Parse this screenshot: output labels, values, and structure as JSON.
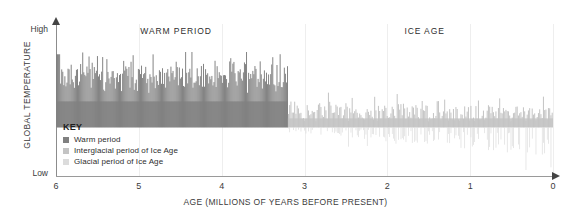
{
  "chart_data": {
    "type": "area",
    "title": "",
    "xlabel": "AGE (MILLIONS OF YEARS BEFORE PRESENT)",
    "ylabel": "GLOBAL TEMPERATURE",
    "xlim": [
      6,
      0
    ],
    "xtick_labels": [
      "6",
      "5",
      "4",
      "3",
      "2",
      "1",
      "0"
    ],
    "xticks": [
      6,
      5,
      4,
      3,
      2,
      1,
      0
    ],
    "ylim_labels": [
      "Low",
      "High"
    ],
    "y_high_label": "High",
    "y_low_label": "Low",
    "grid": "vertical-only",
    "legend_position": "inside-lower-left",
    "annotations": [
      {
        "text": "WARM PERIOD",
        "x": 4.55,
        "note": "spans roughly 6.0 to 3.2 Ma"
      },
      {
        "text": "ICE AGE",
        "x": 1.55,
        "note": "spans roughly 3.2 Ma to present"
      }
    ],
    "series": [
      {
        "name": "Warm period",
        "color": "#808080",
        "x_range": [
          6.0,
          3.2
        ],
        "baseline_level": 0.32,
        "description": "Dense high-frequency oscillation of global temperature held above the mid baseline; amplitude peaks reach near the upper plot region with no excursions below baseline.",
        "values": [
          0.52,
          0.6,
          0.47,
          0.55,
          0.66,
          0.49,
          0.58,
          0.44,
          0.63,
          0.51,
          0.57,
          0.69,
          0.46,
          0.54,
          0.62,
          0.48,
          0.71,
          0.53,
          0.45,
          0.64,
          0.5,
          0.59,
          0.43,
          0.67,
          0.55,
          0.49,
          0.61,
          0.7,
          0.46,
          0.56,
          0.52,
          0.65,
          0.44,
          0.58,
          0.73,
          0.47,
          0.54,
          0.63,
          0.5,
          0.68,
          0.45,
          0.57,
          0.6,
          0.48,
          0.66,
          0.53,
          0.42,
          0.71,
          0.55,
          0.49,
          0.62,
          0.58,
          0.46,
          0.75,
          0.51,
          0.59,
          0.44,
          0.64,
          0.53,
          0.47,
          0.69,
          0.56,
          0.43,
          0.61,
          0.72,
          0.5,
          0.57,
          0.48,
          0.65,
          0.54,
          0.45,
          0.7,
          0.52,
          0.6,
          0.46,
          0.67,
          0.55,
          0.49,
          0.63,
          0.58,
          0.42,
          0.74,
          0.51,
          0.56,
          0.47,
          0.66,
          0.53,
          0.61,
          0.44,
          0.69,
          0.5,
          0.58,
          0.45,
          0.64,
          0.55,
          0.48,
          0.72,
          0.57,
          0.43,
          0.62,
          0.52,
          0.68,
          0.46,
          0.59,
          0.54,
          0.5,
          0.65,
          0.47,
          0.71,
          0.56,
          0.44,
          0.6,
          0.53,
          0.49,
          0.67,
          0.58,
          0.45,
          0.63,
          0.51,
          0.7,
          0.48,
          0.57,
          0.42,
          0.66,
          0.54,
          0.61,
          0.46,
          0.73,
          0.52,
          0.59,
          0.47,
          0.64,
          0.55,
          0.43,
          0.68,
          0.5,
          0.62,
          0.45,
          0.58,
          0.53,
          0.69,
          0.48
        ]
      },
      {
        "name": "Interglacial period of Ice Age",
        "color": "#c4c4c4",
        "x_range": [
          3.2,
          0.0
        ],
        "baseline_level": 0.32,
        "description": "Lighter-toned positive oscillations above the baseline after the onset of the Ice Age; amplitudes are smaller and sparser than the warm period."
      },
      {
        "name": "Glacial period of Ice Age",
        "color": "#d8d8d8",
        "x_range": [
          3.2,
          0.0
        ],
        "baseline_level": 0.32,
        "description": "Downward excursions below the baseline representing glacial maxima; these deepen progressively toward the present, with the deepest spikes in the last 1 million years."
      }
    ]
  },
  "axes": {
    "y_title": "GLOBAL TEMPERATURE",
    "y_high": "High",
    "y_low": "Low",
    "x_title": "AGE (MILLIONS OF YEARS BEFORE PRESENT)",
    "x_ticks": [
      "6",
      "5",
      "4",
      "3",
      "2",
      "1",
      "0"
    ]
  },
  "band_labels": {
    "warm": "WARM PERIOD",
    "ice": "ICE AGE"
  },
  "legend": {
    "title": "KEY",
    "items": [
      {
        "label": "Warm period",
        "color": "#808080"
      },
      {
        "label": "Interglacial period of Ice Age",
        "color": "#c4c4c4"
      },
      {
        "label": "Glacial period of Ice Age",
        "color": "#dcdcdc"
      }
    ]
  },
  "colors": {
    "warm": "#808080",
    "interglacial": "#c4c4c4",
    "glacial": "#dcdcdc",
    "axis": "#8c8c8c",
    "grid": "#eeeeee",
    "text": "#2e2e2e",
    "background": "#ffffff"
  }
}
